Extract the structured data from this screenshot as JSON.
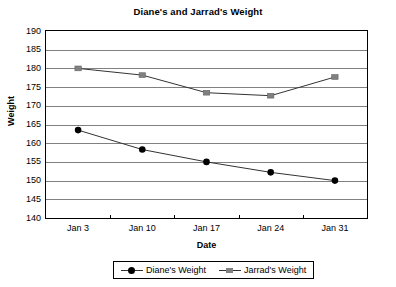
{
  "chart_data": {
    "type": "line",
    "title": "Diane's and Jarrad's Weight",
    "xlabel": "Date",
    "ylabel": "Weight",
    "categories": [
      "Jan 3",
      "Jan 10",
      "Jan 17",
      "Jan 24",
      "Jan 31"
    ],
    "ylim": [
      140,
      190
    ],
    "yticks": [
      140,
      145,
      150,
      155,
      160,
      165,
      170,
      175,
      180,
      185,
      190
    ],
    "ytick_labels": [
      "140",
      "145",
      "150",
      "155",
      "160",
      "165",
      "170",
      "175",
      "180",
      "185",
      "190"
    ],
    "grid": true,
    "grid_axis": "y",
    "legend_position": "bottom",
    "series": [
      {
        "name": "Diane's Weight",
        "values": [
          163.5,
          158.3,
          155.0,
          152.2,
          150.0
        ],
        "color": "#000000",
        "marker": "circle"
      },
      {
        "name": "Jarrad's Weight",
        "values": [
          180.0,
          178.2,
          173.5,
          172.7,
          177.7
        ],
        "color": "#808080",
        "marker": "square"
      }
    ]
  },
  "legend": {
    "entries": [
      {
        "label": "Diane's Weight"
      },
      {
        "label": "Jarrad's Weight"
      }
    ]
  },
  "colors": {
    "axis": "#000000",
    "gridline": "#808080",
    "background": "#ffffff",
    "series_diane": "#000000",
    "series_jarrad": "#808080"
  }
}
